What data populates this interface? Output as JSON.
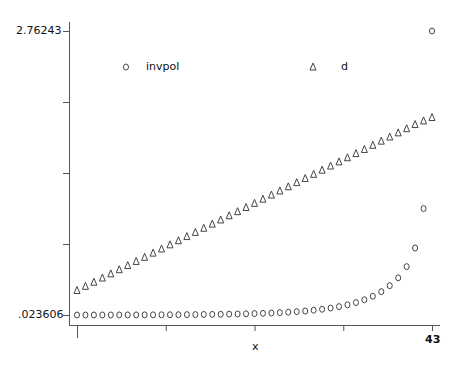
{
  "chart_data": {
    "type": "scatter",
    "title": "",
    "xlabel": "x",
    "ylabel": "",
    "xlim": [
      1,
      43
    ],
    "ylim": [
      0.023606,
      2.76243
    ],
    "x_tick_labels": [
      "1",
      "43"
    ],
    "y_tick_labels": [
      "2.76243",
      ".023606"
    ],
    "grid": false,
    "legend_position": "top-inside",
    "x": [
      1,
      2,
      3,
      4,
      5,
      6,
      7,
      8,
      9,
      10,
      11,
      12,
      13,
      14,
      15,
      16,
      17,
      18,
      19,
      20,
      21,
      22,
      23,
      24,
      25,
      26,
      27,
      28,
      29,
      30,
      31,
      32,
      33,
      34,
      35,
      36,
      37,
      38,
      39,
      40,
      41,
      42,
      43
    ],
    "series": [
      {
        "name": "invpol",
        "marker": "circle",
        "values": [
          0.0236,
          0.0237,
          0.0238,
          0.0239,
          0.024,
          0.0242,
          0.0244,
          0.0246,
          0.0249,
          0.0252,
          0.0256,
          0.026,
          0.0265,
          0.0271,
          0.0278,
          0.0286,
          0.0295,
          0.0306,
          0.0319,
          0.0334,
          0.0352,
          0.0373,
          0.0398,
          0.0428,
          0.0464,
          0.0507,
          0.0559,
          0.0622,
          0.0698,
          0.0791,
          0.0905,
          0.1045,
          0.1218,
          0.1434,
          0.1705,
          0.2048,
          0.2488,
          0.306,
          0.382,
          0.49,
          0.67,
          1.05,
          2.7624
        ]
      },
      {
        "name": "d",
        "marker": "triangle",
        "values": [
          0.265,
          0.305,
          0.345,
          0.385,
          0.425,
          0.465,
          0.505,
          0.545,
          0.585,
          0.625,
          0.665,
          0.705,
          0.745,
          0.785,
          0.825,
          0.865,
          0.905,
          0.945,
          0.985,
          1.025,
          1.065,
          1.105,
          1.145,
          1.185,
          1.225,
          1.265,
          1.305,
          1.345,
          1.385,
          1.425,
          1.465,
          1.505,
          1.545,
          1.585,
          1.625,
          1.665,
          1.705,
          1.745,
          1.785,
          1.825,
          1.865,
          1.9,
          1.933
        ]
      }
    ]
  },
  "legend": {
    "items": [
      {
        "label": "invpol",
        "marker": "circle"
      },
      {
        "label": "d",
        "marker": "triangle"
      }
    ]
  },
  "axes": {
    "xlabel": "x",
    "x_tick_min": "1",
    "x_tick_max": "43",
    "y_tick_max": "2.76243",
    "y_tick_min": ".023606"
  },
  "colors": {
    "marker_stroke": "#444444",
    "axis": "#555555",
    "text": "#111111"
  }
}
